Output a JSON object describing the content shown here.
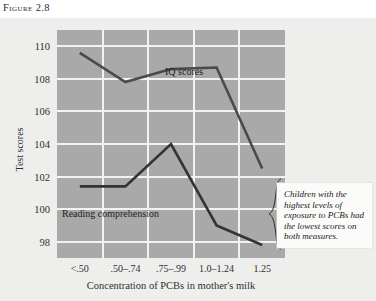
{
  "figure": {
    "label": "Figure 2.8"
  },
  "callout": {
    "text": "Children with the highest levels of exposure to PCBs had the lowest scores on both measures."
  },
  "chart_data": {
    "type": "line",
    "title": "",
    "xlabel": "Concentration of PCBs in mother's milk",
    "ylabel": "Test scores",
    "categories": [
      "<.50",
      ".50–.74",
      ".75–.99",
      "1.0–1.24",
      "1.25"
    ],
    "yticks": [
      98,
      100,
      102,
      104,
      106,
      108,
      110
    ],
    "ylim": [
      97,
      111
    ],
    "grid": true,
    "legend_position": "inline-labels",
    "series": [
      {
        "name": "IQ scores",
        "values": [
          109.6,
          107.8,
          108.6,
          108.7,
          102.5
        ],
        "color": "#4a4a4a"
      },
      {
        "name": "Reading comprehension",
        "values": [
          101.4,
          101.4,
          104.0,
          99.0,
          97.8
        ],
        "color": "#333333"
      }
    ],
    "annotations": [
      {
        "name": "iq-series-label",
        "text": "IQ scores"
      },
      {
        "name": "reading-series-label",
        "text": "Reading comprehension"
      }
    ]
  }
}
